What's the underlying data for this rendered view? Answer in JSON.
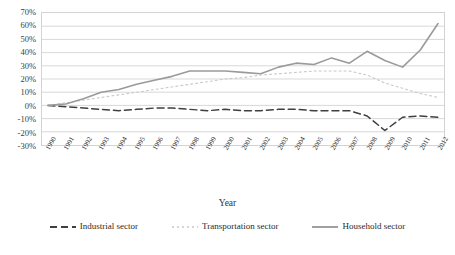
{
  "chart_data": {
    "type": "line",
    "title": "",
    "xlabel": "Year",
    "ylabel": "",
    "grid": true,
    "legend_position": "bottom",
    "ylim": [
      -30,
      70
    ],
    "y_ticks": [
      "70%",
      "60%",
      "50%",
      "40%",
      "30%",
      "20%",
      "10%",
      "0%",
      "-10%",
      "-20%",
      "-30%"
    ],
    "y_tick_values": [
      70,
      60,
      50,
      40,
      30,
      20,
      10,
      0,
      -10,
      -20,
      -30
    ],
    "categories": [
      "1990",
      "1991",
      "1992",
      "1993",
      "1994",
      "1995",
      "1996",
      "1997",
      "1998",
      "1999",
      "2000",
      "2001",
      "2002",
      "2003",
      "2004",
      "2005",
      "2006",
      "2007",
      "2008",
      "2009",
      "2010",
      "2011",
      "2012"
    ],
    "series": [
      {
        "name": "Industrial sector",
        "color": "#3f3f3f",
        "style": "dashed",
        "values": [
          0,
          -1,
          -2,
          -3,
          -4,
          -3,
          -2,
          -2,
          -3,
          -4,
          -3,
          -4,
          -4,
          -3,
          -3,
          -4,
          -4,
          -4,
          -8,
          -19,
          -9,
          -8,
          -9
        ]
      },
      {
        "name": "Transportation sector",
        "color": "#c8c8c8",
        "style": "dotted",
        "values": [
          0,
          2,
          4,
          6,
          8,
          10,
          12,
          14,
          16,
          18,
          20,
          21,
          23,
          24,
          25,
          26,
          26,
          26,
          23,
          17,
          13,
          9,
          6
        ]
      },
      {
        "name": "Household sector",
        "color": "#9a9a9a",
        "style": "solid",
        "values": [
          0,
          1,
          5,
          10,
          12,
          16,
          19,
          22,
          26,
          26,
          26,
          25,
          24,
          29,
          32,
          31,
          36,
          32,
          41,
          34,
          29,
          42,
          62
        ]
      }
    ]
  },
  "axis": {
    "x_title": "Year"
  },
  "legend": {
    "items": [
      {
        "label": "Industrial sector",
        "name": "legend-industrial-sector"
      },
      {
        "label": "Transportation sector",
        "name": "legend-transportation-sector"
      },
      {
        "label": "Household sector",
        "name": "legend-household-sector"
      }
    ]
  }
}
